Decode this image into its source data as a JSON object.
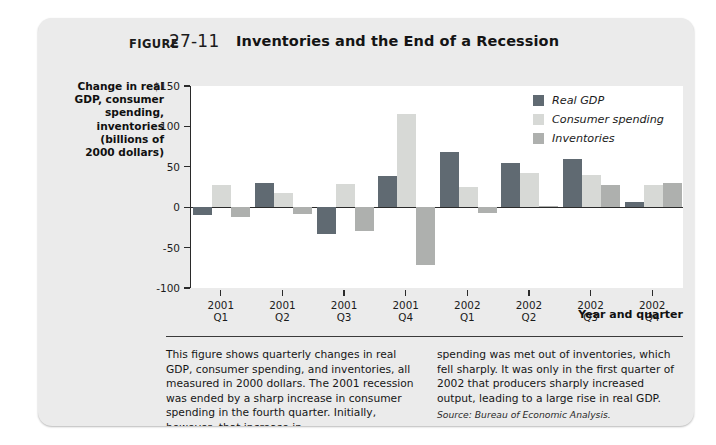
{
  "figure": {
    "label": "Figure",
    "number": "27-11",
    "title": "Inventories and the End of a Recession"
  },
  "chart_data": {
    "type": "bar",
    "title": "Inventories and the End of a Recession",
    "xlabel": "Year and quarter",
    "ylabel": "Change in real GDP, consumer spending, inventories (billions of 2000 dollars)",
    "ylim": [
      -100,
      150
    ],
    "yticks": [
      150,
      100,
      50,
      0,
      -50,
      -100
    ],
    "ytick_labels": [
      "$150",
      "100",
      "50",
      "0",
      "-50",
      "-100"
    ],
    "grid": false,
    "legend_position": "top-right",
    "categories": [
      "2001\nQ1",
      "2001\nQ2",
      "2001\nQ3",
      "2001\nQ4",
      "2002\nQ1",
      "2002\nQ2",
      "2002\nQ3",
      "2002\nQ4"
    ],
    "category_lines": [
      [
        "2001",
        "Q1"
      ],
      [
        "2001",
        "Q2"
      ],
      [
        "2001",
        "Q3"
      ],
      [
        "2001",
        "Q4"
      ],
      [
        "2002",
        "Q1"
      ],
      [
        "2002",
        "Q2"
      ],
      [
        "2002",
        "Q3"
      ],
      [
        "2002",
        "Q4"
      ]
    ],
    "series": [
      {
        "name": "Real GDP",
        "color": "#606a72",
        "values": [
          -10,
          30,
          -33,
          38,
          68,
          55,
          60,
          7
        ]
      },
      {
        "name": "Consumer spending",
        "color": "#d7d9d6",
        "values": [
          28,
          17,
          29,
          115,
          25,
          42,
          40,
          28
        ]
      },
      {
        "name": "Inventories",
        "color": "#aeb0ae",
        "values": [
          -12,
          -8,
          -30,
          -72,
          -7,
          2,
          28,
          30
        ]
      }
    ]
  },
  "caption": {
    "left": "This figure shows quarterly changes in real GDP, consumer spending, and inventories, all measured in 2000 dollars. The 2001 recession was ended by a sharp increase in consumer spending in the fourth quarter. Initially, however, that increase in",
    "right": "spending was met out of inventories, which fell sharply. It was only in the first quarter of 2002 that producers sharply increased output, leading to a large rise in real GDP.",
    "source": "Source: Bureau of Economic Analysis."
  }
}
